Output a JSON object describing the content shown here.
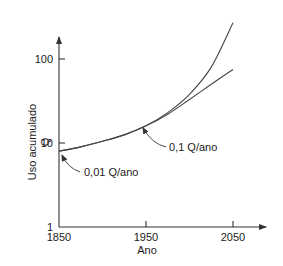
{
  "chart_data": {
    "type": "line",
    "title": "",
    "xlabel": "Ano",
    "ylabel": "Uso acumulado",
    "ylabel_unit": "Q",
    "xlim": [
      1850,
      2085
    ],
    "ylim": [
      1,
      300
    ],
    "yscale": "log",
    "grid": false,
    "x_ticks": [
      1850,
      1950,
      2050
    ],
    "x_tick_labels": [
      "1850",
      "1950",
      "2050"
    ],
    "y_ticks": [
      1,
      10,
      100
    ],
    "y_tick_labels": [
      "1",
      "10",
      "100"
    ],
    "series": [
      {
        "name": "exponential",
        "x": [
          1850,
          1875,
          1900,
          1925,
          1950,
          1975,
          2000,
          2025,
          2050
        ],
        "y": [
          8,
          9,
          10.5,
          12.5,
          16,
          23,
          38,
          80,
          270
        ]
      },
      {
        "name": "linear-tangent",
        "x": [
          1850,
          1875,
          1900,
          1925,
          1950,
          1975,
          2000,
          2025,
          2050
        ],
        "y": [
          8,
          9,
          10.5,
          12.5,
          16,
          22,
          33,
          50,
          75
        ]
      }
    ],
    "annotations": [
      {
        "text": "0,01 Q/ano",
        "x": 1850,
        "y": 8
      },
      {
        "text": "0,1 Q/ano",
        "x": 1950,
        "y": 16
      }
    ]
  }
}
